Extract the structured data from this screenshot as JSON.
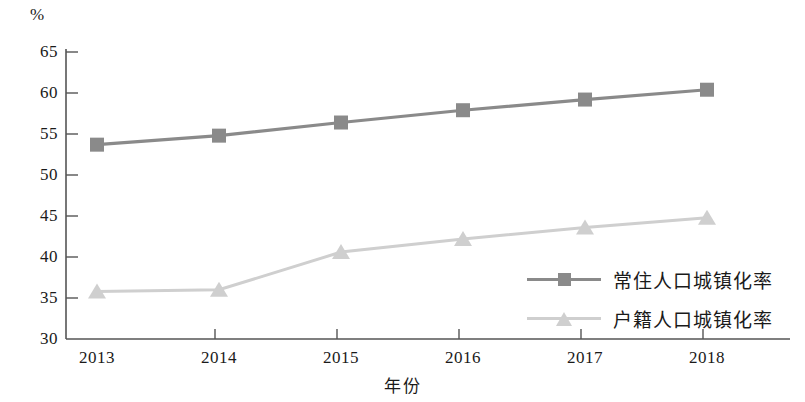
{
  "chart_data": {
    "type": "line",
    "title": "",
    "xlabel": "年份",
    "ylabel": "%",
    "unit_label": "%",
    "categories": [
      "2013",
      "2014",
      "2015",
      "2016",
      "2017",
      "2018"
    ],
    "x": [
      2013,
      2014,
      2015,
      2016,
      2017,
      2018
    ],
    "ylim": [
      30,
      65
    ],
    "yticks": [
      65,
      60,
      55,
      50,
      45,
      40,
      35,
      30
    ],
    "grid": false,
    "legend_position": "center-right",
    "series": [
      {
        "name": "常住人口城镇化率",
        "marker": "square",
        "color": "#8a8a8a",
        "values": [
          53.7,
          54.8,
          56.4,
          57.9,
          59.2,
          60.4
        ]
      },
      {
        "name": "户籍人口城镇化率",
        "marker": "triangle",
        "color": "#cfcfcf",
        "values": [
          35.8,
          36.0,
          40.6,
          42.2,
          43.6,
          44.8
        ]
      }
    ]
  },
  "axis": {
    "unit": "%",
    "x_title": "年份",
    "y_tick_labels": [
      "65",
      "60",
      "55",
      "50",
      "45",
      "40",
      "35",
      "30"
    ],
    "x_tick_labels": [
      "2013",
      "2014",
      "2015",
      "2016",
      "2017",
      "2018"
    ]
  },
  "legend": {
    "items": [
      {
        "label": "常住人口城镇化率"
      },
      {
        "label": "户籍人口城镇化率"
      }
    ]
  },
  "colors": {
    "series_1": "#8a8a8a",
    "series_2": "#cfcfcf",
    "axis": "#555555",
    "text": "#1a1a1a"
  }
}
